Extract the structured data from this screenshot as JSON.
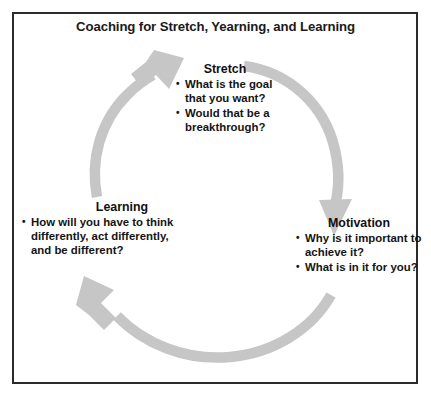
{
  "figure": {
    "title": "Coaching for Stretch, Yearning, and Learning",
    "frame_color": "#2b2b2b",
    "background_color": "#ffffff",
    "arrow_color": "#c6c6c6",
    "text_color": "#121212"
  },
  "cycle": {
    "direction": "clockwise",
    "stages": [
      {
        "id": "stretch",
        "heading": "Stretch",
        "bullets": [
          "What is the goal that you want?",
          "Would that be a breakthrough?"
        ]
      },
      {
        "id": "motivation",
        "heading": "Motivation",
        "bullets": [
          "Why is it important to achieve it?",
          "What is in it for you?"
        ]
      },
      {
        "id": "learning",
        "heading": "Learning",
        "bullets": [
          "How will you have to think differently, act differently, and be different?"
        ]
      }
    ],
    "arrows": [
      {
        "id": "arrow-to-motivation",
        "from": "stretch",
        "to": "motivation",
        "head_direction": "down"
      },
      {
        "id": "arrow-to-learning",
        "from": "motivation",
        "to": "learning",
        "head_direction": "up-left"
      },
      {
        "id": "arrow-to-stretch",
        "from": "learning",
        "to": "stretch",
        "head_direction": "up-right"
      }
    ]
  }
}
